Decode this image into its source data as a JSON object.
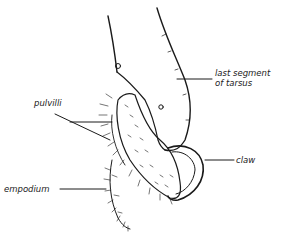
{
  "diagram": {
    "labels": {
      "last_segment_line1": "last segment",
      "last_segment_line2": "of tarsus",
      "pulvilli": "pulvilli",
      "claw": "claw",
      "empodium": "empodium"
    },
    "colors": {
      "ink": "#1a1a1a",
      "background": "#ffffff"
    }
  }
}
